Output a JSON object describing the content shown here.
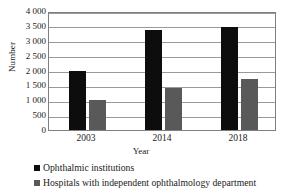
{
  "chart_data": {
    "type": "bar",
    "title": "",
    "xlabel": "Year",
    "ylabel": "Number",
    "categories": [
      "2003",
      "2014",
      "2018"
    ],
    "series": [
      {
        "name": "Ophthalmic institutions",
        "color": "#0d0d0d",
        "values": [
          2000,
          3350,
          3450
        ]
      },
      {
        "name": "Hospitals with independent ophthalmology department",
        "color": "#595959",
        "values": [
          1000,
          1400,
          1700
        ]
      }
    ],
    "ylim": [
      0,
      4000
    ],
    "yticks": [
      0,
      500,
      1000,
      1500,
      2000,
      2500,
      3000,
      3500,
      4000
    ],
    "ytick_labels": [
      "0",
      "500",
      "1 000",
      "1 500",
      "2 000",
      "2 500",
      "3 000",
      "3 500",
      "4 000"
    ],
    "grid": true,
    "legend_position": "bottom-left"
  },
  "legend": {
    "items": [
      {
        "label": "Ophthalmic institutions",
        "swatch_color": "#0d0d0d"
      },
      {
        "label": "Hospitals with independent ophthalmology department",
        "swatch_color": "#595959"
      }
    ]
  },
  "axes": {
    "y_title": "Number",
    "x_title": "Year"
  }
}
